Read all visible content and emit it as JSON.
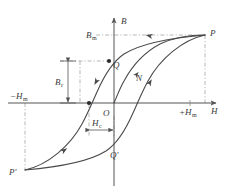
{
  "figure": {
    "background_color": "#ffffff",
    "curve_color": "#4a4a4a",
    "axis_color": "#555555",
    "dash_color": "#9a9a9a",
    "label_color": "#3a3a3a"
  },
  "axes": {
    "vertical_label": "B",
    "horizontal_label": "H",
    "origin_label": "O",
    "origin_px": {
      "x": 114,
      "y": 103
    },
    "x_range_px": {
      "min": 8,
      "max": 222
    },
    "y_range_px": {
      "min": 14,
      "max": 186
    }
  },
  "labels": {
    "b_max": {
      "base": "B",
      "sub": "m",
      "x": 93,
      "y": 36
    },
    "b_remanence": {
      "base": "B",
      "sub": "r",
      "x": 58,
      "y": 79
    },
    "h_coercivity": {
      "base": "H",
      "sub": "c",
      "x": 85,
      "y": 126
    },
    "h_max_negative": {
      "base": "−H",
      "sub": "m",
      "x": 14,
      "y": 98
    },
    "h_max_positive": {
      "base": "+H",
      "sub": "m",
      "x": 183,
      "y": 114
    },
    "point_p": "P",
    "point_p_prime": "P'",
    "point_q": "Q",
    "point_q_prime": "Q'",
    "point_n": "N"
  },
  "points": {
    "P": {
      "x": 205,
      "y": 35,
      "label_x": 210,
      "label_y": 33
    },
    "P_prime": {
      "x": 25,
      "y": 170,
      "label_x": 11,
      "label_y": 172
    },
    "Q": {
      "x": 109,
      "y": 61,
      "label_x": 113,
      "label_y": 66
    },
    "Q_prime": {
      "x": 119,
      "y": 145,
      "label_x": 112,
      "label_y": 155
    },
    "N": {
      "x": 133,
      "y": 72,
      "label_x": 136,
      "label_y": 80
    },
    "coercive_point": {
      "x": 89,
      "y": 103
    }
  },
  "curves": {
    "descending_branch": "M 205,35 C 170,38 140,44 124,54 C 112,62 104,76 97,92 C 92,103 88,113 82,124 C 70,146 48,165 25,170",
    "ascending_branch": "M 25,170 C 60,167 90,161 106,151 C 118,143 126,129 133,113 C 138,102 142,92 148,81 C 160,59 182,40 205,35",
    "initial_magnetization": "M 114,103 C 117,96 120,88 124,81 C 131,68 143,53 160,44 C 175,37 192,35 205,35"
  },
  "dashed_lines": [
    {
      "name": "bm-horizontal",
      "x1": 96,
      "y1": 35,
      "x2": 205,
      "y2": 35
    },
    {
      "name": "p-vertical",
      "x1": 205,
      "y1": 35,
      "x2": 205,
      "y2": 103
    },
    {
      "name": "br-horizontal",
      "x1": 60,
      "y1": 61,
      "x2": 109,
      "y2": 61
    },
    {
      "name": "q-vertical",
      "x1": 80,
      "y1": 61,
      "x2": 80,
      "y2": 103
    },
    {
      "name": "pprime-vertical",
      "x1": 25,
      "y1": 103,
      "x2": 25,
      "y2": 170
    },
    {
      "name": "hc-vertical-left",
      "x1": 89,
      "y1": 103,
      "x2": 89,
      "y2": 135
    },
    {
      "name": "hc-vertical-right",
      "x1": 114,
      "y1": 118,
      "x2": 114,
      "y2": 135
    }
  ],
  "measure_arrows": {
    "br_vertical": {
      "x": 68,
      "y_top": 61,
      "y_bottom": 103
    },
    "hc_horizontal": {
      "y": 130,
      "x_left": 89,
      "x_right": 114
    }
  },
  "direction_arrows": [
    {
      "name": "arrow-upper-branch-left",
      "x": 152,
      "y": 41,
      "angle": 192
    },
    {
      "name": "arrow-upper-branch-Q",
      "x": 101,
      "y": 82,
      "angle": 118
    },
    {
      "name": "arrow-lower-branch-PQ",
      "x": 63,
      "y": 148,
      "angle": 326
    },
    {
      "name": "arrow-lower-branch-right",
      "x": 148,
      "y": 81,
      "angle": 300
    },
    {
      "name": "arrow-initial-curve",
      "x": 136,
      "y": 72,
      "angle": 312
    }
  ]
}
